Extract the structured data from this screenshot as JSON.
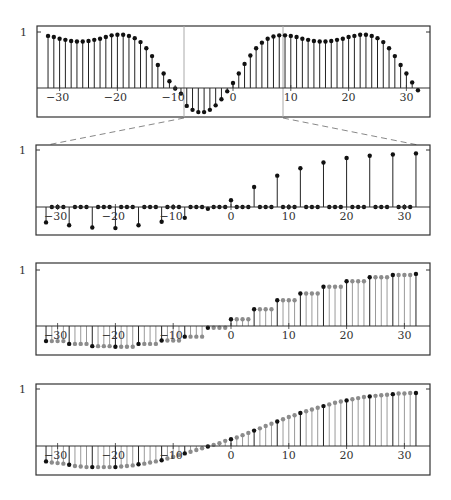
{
  "figure": {
    "width": 451,
    "height": 500,
    "colors": {
      "stem_dark": "#222222",
      "stem_grey": "#9a9a9a",
      "dot_dark": "#111111",
      "dot_grey": "#8c8c8c",
      "frame": "#333333",
      "axis": "#333333",
      "window_line": "#aaaaaa",
      "dashed": "#888888"
    },
    "zoom_window": {
      "left_px": 184,
      "right_px": 283,
      "dash_left": {
        "x1": 184,
        "y1": 118,
        "x2": 47,
        "y2": 145
      },
      "dash_right": {
        "x1": 283,
        "y1": 118,
        "x2": 418,
        "y2": 145
      }
    }
  },
  "chart_data": [
    {
      "id": "panel-1",
      "type": "stem",
      "title": "",
      "xlabel": "",
      "ylabel": "",
      "y_tick_label": "1",
      "xticks": [
        -30,
        -20,
        -10,
        0,
        10,
        20,
        30
      ],
      "xlim": [
        -33,
        34
      ],
      "ylim": [
        -0.55,
        1.1
      ],
      "frame": {
        "left": 37,
        "top": 26,
        "right": 430,
        "bottom": 117,
        "axis_y": 88,
        "one_y": 32,
        "x0": 233,
        "dx": 5.78
      },
      "x": [
        -32,
        -31,
        -30,
        -29,
        -28,
        -27,
        -26,
        -25,
        -24,
        -23,
        -22,
        -21,
        -20,
        -19,
        -18,
        -17,
        -16,
        -15,
        -14,
        -13,
        -12,
        -11,
        -10,
        -9,
        -8,
        -7,
        -6,
        -5,
        -4,
        -3,
        -2,
        -1,
        0,
        1,
        2,
        3,
        4,
        5,
        6,
        7,
        8,
        9,
        10,
        11,
        12,
        13,
        14,
        15,
        16,
        17,
        18,
        19,
        20,
        21,
        22,
        23,
        24,
        25,
        26,
        27,
        28,
        29,
        30,
        31,
        32
      ],
      "series": [
        {
          "name": "x[n]",
          "style": "dark",
          "values": [
            0.93,
            0.91,
            0.88,
            0.86,
            0.84,
            0.83,
            0.83,
            0.84,
            0.86,
            0.88,
            0.91,
            0.94,
            0.95,
            0.95,
            0.93,
            0.89,
            0.82,
            0.71,
            0.57,
            0.41,
            0.26,
            0.12,
            -0.01,
            -0.1,
            -0.32,
            -0.39,
            -0.43,
            -0.43,
            -0.39,
            -0.31,
            -0.2,
            -0.06,
            0.09,
            0.26,
            0.43,
            0.58,
            0.71,
            0.81,
            0.88,
            0.92,
            0.94,
            0.94,
            0.93,
            0.91,
            0.88,
            0.86,
            0.84,
            0.83,
            0.83,
            0.84,
            0.86,
            0.88,
            0.91,
            0.93,
            0.95,
            0.95,
            0.93,
            0.89,
            0.82,
            0.71,
            0.57,
            0.41,
            0.26,
            0.1,
            -0.04
          ]
        }
      ],
      "annotations": [
        "zoom window between vertical lines at n≈-8.5 and n≈8.5"
      ]
    },
    {
      "id": "panel-2",
      "type": "stem",
      "title": "",
      "xlabel": "",
      "ylabel": "",
      "y_tick_label": "1",
      "xticks": [
        -30,
        -20,
        -10,
        0,
        10,
        20,
        30
      ],
      "xlim": [
        -33,
        34
      ],
      "ylim": [
        -0.45,
        1.05
      ],
      "frame": {
        "left": 36,
        "top": 145,
        "right": 430,
        "bottom": 235,
        "axis_y": 207,
        "one_y": 150,
        "x0": 231,
        "dx": 5.78
      },
      "x": [
        -32,
        -31,
        -30,
        -29,
        -28,
        -27,
        -26,
        -25,
        -24,
        -23,
        -22,
        -21,
        -20,
        -19,
        -18,
        -17,
        -16,
        -15,
        -14,
        -13,
        -12,
        -11,
        -10,
        -9,
        -8,
        -7,
        -6,
        -5,
        -4,
        -3,
        -2,
        -1,
        0,
        1,
        2,
        3,
        4,
        5,
        6,
        7,
        8,
        9,
        10,
        11,
        12,
        13,
        14,
        15,
        16,
        17,
        18,
        19,
        20,
        21,
        22,
        23,
        24,
        25,
        26,
        27,
        28,
        29,
        30,
        31,
        32
      ],
      "series": [
        {
          "name": "upsampled x[n] (nonzero every 4th sample)",
          "style": "dark",
          "values": [
            -0.27,
            0,
            0,
            0,
            -0.32,
            0,
            0,
            0,
            -0.36,
            0,
            0,
            0,
            -0.37,
            0,
            0,
            0,
            -0.32,
            0,
            0,
            0,
            -0.26,
            0,
            0,
            0,
            -0.19,
            0,
            0,
            0,
            -0.03,
            0,
            0,
            0,
            0.12,
            0,
            0,
            0,
            0.35,
            0,
            0,
            0,
            0.55,
            0,
            0,
            0,
            0.68,
            0,
            0,
            0,
            0.78,
            0,
            0,
            0,
            0.86,
            0,
            0,
            0,
            0.9,
            0,
            0,
            0,
            0.92,
            0,
            0,
            0,
            0.94
          ]
        }
      ]
    },
    {
      "id": "panel-3",
      "type": "stem",
      "title": "",
      "xlabel": "",
      "ylabel": "",
      "y_tick_label": "1",
      "xticks": [
        -30,
        -20,
        -10,
        0,
        10,
        20,
        30
      ],
      "xlim": [
        -33,
        34
      ],
      "ylim": [
        -0.45,
        1.05
      ],
      "frame": {
        "left": 36,
        "top": 263,
        "right": 430,
        "bottom": 355,
        "axis_y": 326,
        "one_y": 270,
        "x0": 231,
        "dx": 5.78
      },
      "x": [
        -32,
        -31,
        -30,
        -29,
        -28,
        -27,
        -26,
        -25,
        -24,
        -23,
        -22,
        -21,
        -20,
        -19,
        -18,
        -17,
        -16,
        -15,
        -14,
        -13,
        -12,
        -11,
        -10,
        -9,
        -8,
        -7,
        -6,
        -5,
        -4,
        -3,
        -2,
        -1,
        0,
        1,
        2,
        3,
        4,
        5,
        6,
        7,
        8,
        9,
        10,
        11,
        12,
        13,
        14,
        15,
        16,
        17,
        18,
        19,
        20,
        21,
        22,
        23,
        24,
        25,
        26,
        27,
        28,
        29,
        30,
        31,
        32
      ],
      "series": [
        {
          "name": "zero-order hold (black = original samples, grey = held)",
          "style": "hold",
          "values": [
            -0.27,
            -0.27,
            -0.27,
            -0.27,
            -0.32,
            -0.32,
            -0.32,
            -0.32,
            -0.36,
            -0.36,
            -0.36,
            -0.36,
            -0.37,
            -0.37,
            -0.37,
            -0.37,
            -0.32,
            -0.32,
            -0.32,
            -0.32,
            -0.26,
            -0.26,
            -0.26,
            -0.26,
            -0.19,
            -0.19,
            -0.19,
            -0.19,
            -0.03,
            -0.03,
            -0.03,
            -0.03,
            0.12,
            0.12,
            0.12,
            0.12,
            0.3,
            0.3,
            0.3,
            0.3,
            0.46,
            0.46,
            0.46,
            0.46,
            0.58,
            0.58,
            0.58,
            0.58,
            0.7,
            0.7,
            0.7,
            0.7,
            0.8,
            0.8,
            0.8,
            0.8,
            0.87,
            0.87,
            0.87,
            0.87,
            0.91,
            0.91,
            0.91,
            0.91,
            0.93
          ]
        }
      ]
    },
    {
      "id": "panel-4",
      "type": "stem",
      "title": "",
      "xlabel": "",
      "ylabel": "",
      "y_tick_label": "1",
      "xticks": [
        -30,
        -20,
        -10,
        0,
        10,
        20,
        30
      ],
      "xlim": [
        -33,
        34
      ],
      "ylim": [
        -0.45,
        1.05
      ],
      "frame": {
        "left": 36,
        "top": 384,
        "right": 430,
        "bottom": 475,
        "axis_y": 446,
        "one_y": 389,
        "x0": 231,
        "dx": 5.78
      },
      "x": [
        -32,
        -31,
        -30,
        -29,
        -28,
        -27,
        -26,
        -25,
        -24,
        -23,
        -22,
        -21,
        -20,
        -19,
        -18,
        -17,
        -16,
        -15,
        -14,
        -13,
        -12,
        -11,
        -10,
        -9,
        -8,
        -7,
        -6,
        -5,
        -4,
        -3,
        -2,
        -1,
        0,
        1,
        2,
        3,
        4,
        5,
        6,
        7,
        8,
        9,
        10,
        11,
        12,
        13,
        14,
        15,
        16,
        17,
        18,
        19,
        20,
        21,
        22,
        23,
        24,
        25,
        26,
        27,
        28,
        29,
        30,
        31,
        32
      ],
      "series": [
        {
          "name": "interpolated (black = original samples, grey = interpolated)",
          "style": "hold",
          "values": [
            -0.27,
            -0.29,
            -0.3,
            -0.31,
            -0.33,
            -0.35,
            -0.36,
            -0.37,
            -0.37,
            -0.37,
            -0.37,
            -0.37,
            -0.37,
            -0.36,
            -0.35,
            -0.34,
            -0.32,
            -0.31,
            -0.29,
            -0.27,
            -0.25,
            -0.22,
            -0.19,
            -0.16,
            -0.13,
            -0.1,
            -0.07,
            -0.04,
            -0.01,
            0.02,
            0.05,
            0.09,
            0.12,
            0.15,
            0.19,
            0.23,
            0.27,
            0.31,
            0.35,
            0.39,
            0.43,
            0.47,
            0.51,
            0.54,
            0.58,
            0.61,
            0.64,
            0.67,
            0.7,
            0.73,
            0.76,
            0.78,
            0.8,
            0.82,
            0.84,
            0.86,
            0.87,
            0.88,
            0.89,
            0.9,
            0.91,
            0.92,
            0.92,
            0.93,
            0.93
          ]
        }
      ]
    }
  ]
}
